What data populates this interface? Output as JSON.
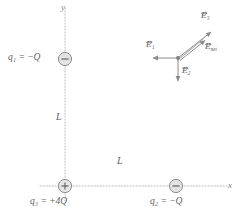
{
  "figure": {
    "background_color": "#ffffff",
    "line_color": "#b0b0b0",
    "text_color": "#5f5f5f",
    "vector_color": "#8a8a8a"
  },
  "axes": {
    "x_label": "x",
    "y_label": "y",
    "origin": {
      "x": 65,
      "y": 186
    },
    "x_axis": {
      "x1": 40,
      "y1": 186,
      "x2": 232,
      "y2": 186
    },
    "y_axis": {
      "x1": 65,
      "y1": 8,
      "x2": 65,
      "y2": 203
    },
    "style": "dotted"
  },
  "charges": [
    {
      "id": "q1",
      "label": "q",
      "subscript": "1",
      "equals": " = ",
      "value": "−Q",
      "full_label": "q₁ = −Q",
      "sign": "minus",
      "symbol": "−",
      "position": {
        "x": 65,
        "y": 59
      },
      "label_position": {
        "x": 8,
        "y": 53
      },
      "radius": 7
    },
    {
      "id": "q3",
      "label": "q",
      "subscript": "3",
      "equals": " = ",
      "value": "+4Q",
      "full_label": "q₃ = +4Q",
      "sign": "plus",
      "symbol": "+",
      "position": {
        "x": 65,
        "y": 186
      },
      "label_position": {
        "x": 30,
        "y": 197
      },
      "radius": 7
    },
    {
      "id": "q2",
      "label": "q",
      "subscript": "2",
      "equals": " = ",
      "value": "−Q",
      "full_label": "q₂ = −Q",
      "sign": "minus",
      "symbol": "−",
      "position": {
        "x": 176,
        "y": 186
      },
      "label_position": {
        "x": 151,
        "y": 197
      },
      "radius": 7
    }
  ],
  "distances": [
    {
      "id": "L-vertical",
      "label": "L",
      "between": [
        "q1",
        "q3"
      ],
      "position": {
        "x": 57,
        "y": 117
      }
    },
    {
      "id": "L-horizontal",
      "label": "L",
      "between": [
        "q3",
        "q2"
      ],
      "position": {
        "x": 118,
        "y": 161
      }
    }
  ],
  "field_vectors": {
    "origin": {
      "x": 178,
      "y": 58
    },
    "items": [
      {
        "id": "E1",
        "label": "E",
        "subscript": "1",
        "full_label": "E₁",
        "direction": "left",
        "tip": {
          "x": 151,
          "y": 58
        },
        "label_position": {
          "x": 148,
          "y": 42
        }
      },
      {
        "id": "E2",
        "label": "E",
        "subscript": "2",
        "full_label": "E₂",
        "direction": "down",
        "tip": {
          "x": 178,
          "y": 83
        },
        "label_position": {
          "x": 182,
          "y": 68
        }
      },
      {
        "id": "E3",
        "label": "E",
        "subscript": "3",
        "full_label": "E₃",
        "direction": "up-right",
        "tip": {
          "x": 213,
          "y": 30
        },
        "label_position": {
          "x": 202,
          "y": 13
        }
      },
      {
        "id": "Enet",
        "label": "E",
        "subscript": "net",
        "full_label": "E_net",
        "direction": "up-right",
        "tip": {
          "x": 207,
          "y": 36
        },
        "label_position": {
          "x": 206,
          "y": 44
        }
      }
    ]
  }
}
